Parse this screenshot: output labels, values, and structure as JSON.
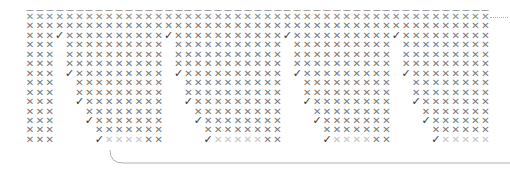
{
  "glyphs": {
    "cross": "✕",
    "check": "✓"
  },
  "colors": {
    "cross": "#7a7a7a",
    "cross_light": "#c4c4c4",
    "check": "#333333",
    "line": "#b0b0b0"
  },
  "grid": {
    "columns": 47,
    "rows": 14,
    "origin_x": 25,
    "origin_y": 12,
    "pitch_x": 9.9,
    "pitch_y": 9.45,
    "sections": [
      {
        "left_block": [
          0,
          2
        ],
        "gap_start": 3,
        "end_col": 11
      },
      {
        "left_block": [
          12,
          13
        ],
        "gap_start": 14,
        "end_col": 23
      },
      {
        "left_block": [
          24,
          25
        ],
        "gap_start": 26,
        "end_col": 34
      },
      {
        "left_block": [
          35,
          36
        ],
        "gap_start": 37,
        "end_col": 46
      }
    ],
    "staircase": [
      {
        "row": 2,
        "check_offset": 0,
        "x_from_offset": 1
      },
      {
        "row": 3,
        "check_offset": null,
        "x_from_offset": 1
      },
      {
        "row": 4,
        "check_offset": null,
        "x_from_offset": 1
      },
      {
        "row": 5,
        "check_offset": null,
        "x_from_offset": 1
      },
      {
        "row": 6,
        "check_offset": 1,
        "x_from_offset": 2
      },
      {
        "row": 7,
        "check_offset": null,
        "x_from_offset": 2
      },
      {
        "row": 8,
        "check_offset": null,
        "x_from_offset": 2
      },
      {
        "row": 9,
        "check_offset": 2,
        "x_from_offset": 3
      },
      {
        "row": 10,
        "check_offset": null,
        "x_from_offset": 3
      },
      {
        "row": 11,
        "check_offset": 3,
        "x_from_offset": 4
      },
      {
        "row": 12,
        "check_offset": null,
        "x_from_offset": 4
      },
      {
        "row": 13,
        "check_offset": 4,
        "x_from_offset": 5,
        "light": true
      }
    ]
  }
}
